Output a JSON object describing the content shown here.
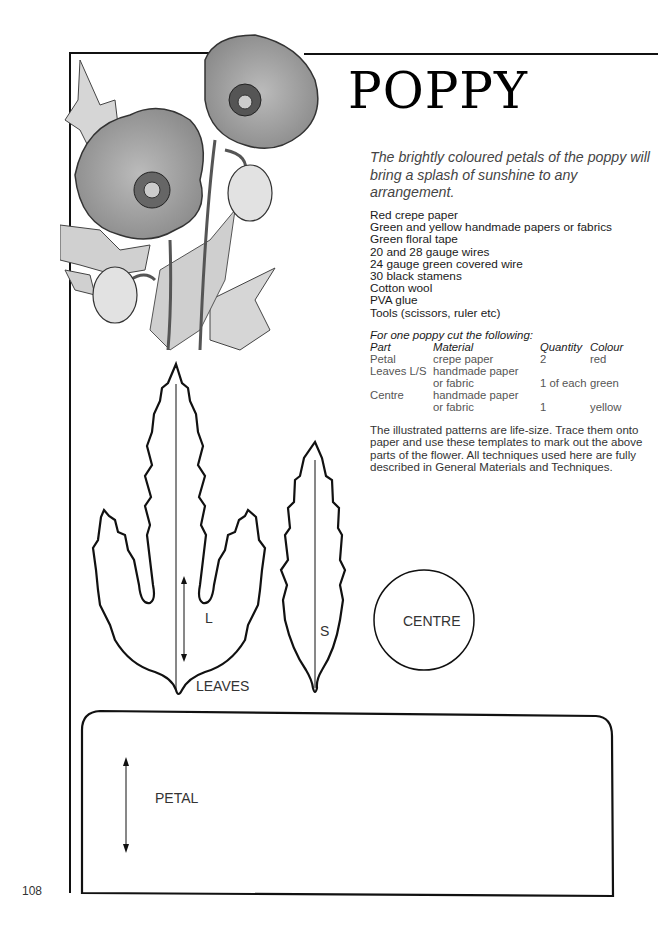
{
  "page": {
    "number": "108",
    "title": "POPPY",
    "intro": "The brightly coloured petals of the poppy will bring a splash of sunshine to any arrangement."
  },
  "materials": [
    "Red crepe paper",
    "Green and yellow handmade papers or fabrics",
    "Green floral tape",
    "20 and 28 gauge wires",
    "24 gauge green covered wire",
    "30 black stamens",
    "Cotton wool",
    "PVA glue",
    "Tools (scissors, ruler etc)"
  ],
  "cutting": {
    "heading": "For one poppy cut the following:",
    "columns": [
      "Part",
      "Material",
      "Quantity",
      "Colour"
    ],
    "rows": [
      {
        "part": "Petal",
        "material": "crepe paper",
        "material2": "",
        "quantity": "2",
        "colour": "red"
      },
      {
        "part": "Leaves L/S",
        "material": "handmade paper",
        "material2": "or fabric",
        "quantity": "1 of each",
        "colour": "green"
      },
      {
        "part": "Centre",
        "material": "handmade paper",
        "material2": "or fabric",
        "quantity": "1",
        "colour": "yellow"
      }
    ]
  },
  "notes": "The illustrated patterns are life-size. Trace them onto paper and use these templates to mark out the above parts of the flower. All techniques used here are fully described in General Materials and Techniques.",
  "templates": {
    "leaf_large_label": "L",
    "leaf_small_label": "S",
    "leaves_label": "LEAVES",
    "centre_label": "CENTRE",
    "petal_label": "PETAL"
  },
  "illustration": {
    "subject": "poppy-flowers-illustration"
  }
}
